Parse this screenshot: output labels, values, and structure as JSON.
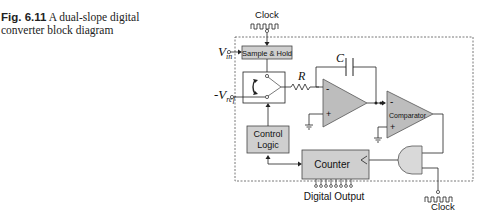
{
  "caption": {
    "figure_number": "Fig. 6.11",
    "text_line1": "A dual-slope digital",
    "text_line2": "converter block diagram"
  },
  "diagram": {
    "clock_top_label": "Clock",
    "clock_bottom_label": "Clock",
    "vin_label": "V",
    "vin_sub": "in",
    "vref_label": "-V",
    "vref_sub": "ref",
    "sample_hold_label": "Sample & Hold",
    "resistor_label": "R",
    "capacitor_label": "C",
    "integrator_minus": "-",
    "integrator_plus": "+",
    "comparator_label": "Comparator",
    "comparator_minus": "-",
    "comparator_plus": "+",
    "control_logic_line1": "Control",
    "control_logic_line2": "Logic",
    "counter_label": "Counter",
    "digital_output_label": "Digital Output",
    "digital_output_bits": 8,
    "colors": {
      "block_fill": "#cfcfcf",
      "opamp_fill": "#bdbdbd",
      "and_gate_fill": "#d9d9d9",
      "line": "#222222",
      "dashed_border": "#555555"
    }
  }
}
